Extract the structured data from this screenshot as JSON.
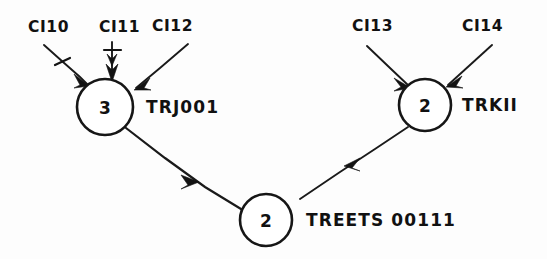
{
  "figure": {
    "kind": "hand-drawn-node-diagram",
    "background_color": "#fdfdfd",
    "ink_color": "#121212",
    "width_px": 547,
    "height_px": 259
  },
  "nodes": [
    {
      "id": "left",
      "number": "3",
      "name": "TRJ001",
      "cx": 105,
      "cy": 107,
      "r": 28
    },
    {
      "id": "right",
      "number": "2",
      "name": "TRKII",
      "cx": 425,
      "cy": 105,
      "r": 26
    },
    {
      "id": "bottom",
      "number": "2",
      "name": "TREETS 00111",
      "cx": 266,
      "cy": 220,
      "r": 26
    }
  ],
  "inputs": [
    {
      "id": "ci10",
      "label": "CI10",
      "x": 28,
      "y": 32,
      "target_node": "left"
    },
    {
      "id": "ci11",
      "label": "CI11",
      "x": 99,
      "y": 32,
      "target_node": "left"
    },
    {
      "id": "ci12",
      "label": "CI12",
      "x": 152,
      "y": 31,
      "target_node": "left"
    },
    {
      "id": "ci13",
      "label": "CI13",
      "x": 352,
      "y": 31,
      "target_node": "right"
    },
    {
      "id": "ci14",
      "label": "CI14",
      "x": 462,
      "y": 31,
      "target_node": "right"
    }
  ],
  "edges": [
    {
      "id": "left-to-bottom",
      "from": "left",
      "to": "bottom",
      "arrow": "mid"
    },
    {
      "id": "right-to-bottom",
      "from": "right",
      "to": "bottom",
      "arrow": "mid"
    }
  ]
}
